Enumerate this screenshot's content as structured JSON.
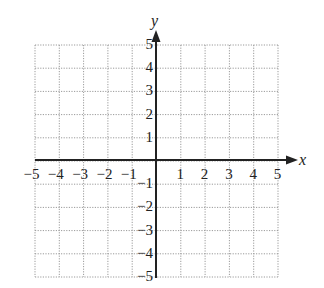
{
  "diagram": {
    "type": "coordinate-plane",
    "x_axis": {
      "label": "x",
      "min": -5,
      "max": 5,
      "ticks": [
        "−5",
        "−4",
        "−3",
        "−2",
        "−1",
        "1",
        "2",
        "3",
        "4",
        "5"
      ]
    },
    "y_axis": {
      "label": "y",
      "min": -5,
      "max": 5,
      "ticks": [
        "5",
        "4",
        "3",
        "2",
        "1",
        "−1",
        "−2",
        "−3",
        "−4",
        "−5"
      ]
    },
    "grid": "dotted",
    "colors": {
      "axis": "#222222",
      "grid": "#9a9a9a"
    }
  }
}
